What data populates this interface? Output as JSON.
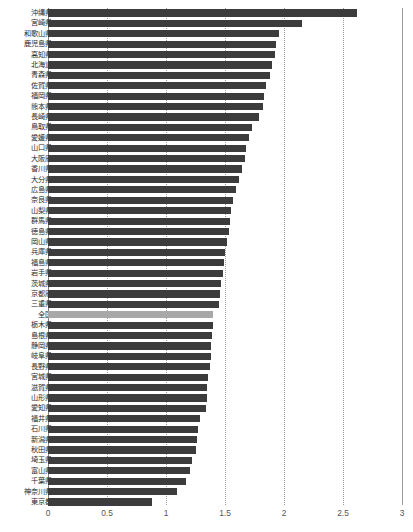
{
  "chart_data": {
    "type": "bar",
    "orientation": "horizontal",
    "title": "",
    "subtitle": "",
    "xlabel": "",
    "ylabel": "",
    "xlim": [
      0,
      3
    ],
    "x_ticks": [
      "0",
      "0.5",
      "1",
      "1.5",
      "2",
      "2.5",
      "3"
    ],
    "x_tick_values": [
      0,
      0.5,
      1,
      1.5,
      2,
      2.5,
      3
    ],
    "grid": true,
    "legend": "none",
    "highlight_category": "全国",
    "highlight_color": "#a8a8a8",
    "bar_color": "#3c3c3c",
    "categories": [
      "沖縄県",
      "宮崎県",
      "和歌山県",
      "鹿児島県",
      "高知県",
      "北海道",
      "青森県",
      "佐賀県",
      "福岡県",
      "熊本県",
      "長崎県",
      "鳥取県",
      "愛媛県",
      "山口県",
      "大阪府",
      "香川県",
      "大分県",
      "広島県",
      "奈良県",
      "山梨県",
      "群馬県",
      "徳島県",
      "岡山県",
      "兵庫県",
      "福島県",
      "岩手県",
      "茨城県",
      "京都府",
      "三重県",
      "全国",
      "栃木県",
      "島根県",
      "静岡県",
      "岐阜県",
      "長野県",
      "宮城県",
      "滋賀県",
      "山形県",
      "愛知県",
      "福井県",
      "石川県",
      "新潟県",
      "秋田県",
      "埼玉県",
      "富山県",
      "千葉県",
      "神奈川県",
      "東京都"
    ],
    "values": [
      2.62,
      2.15,
      1.96,
      1.93,
      1.92,
      1.9,
      1.88,
      1.85,
      1.83,
      1.82,
      1.79,
      1.73,
      1.7,
      1.68,
      1.67,
      1.64,
      1.62,
      1.59,
      1.57,
      1.55,
      1.54,
      1.53,
      1.52,
      1.5,
      1.49,
      1.48,
      1.47,
      1.46,
      1.45,
      1.4,
      1.4,
      1.39,
      1.38,
      1.38,
      1.37,
      1.36,
      1.35,
      1.35,
      1.34,
      1.29,
      1.27,
      1.26,
      1.25,
      1.22,
      1.2,
      1.17,
      1.09,
      0.88
    ]
  }
}
